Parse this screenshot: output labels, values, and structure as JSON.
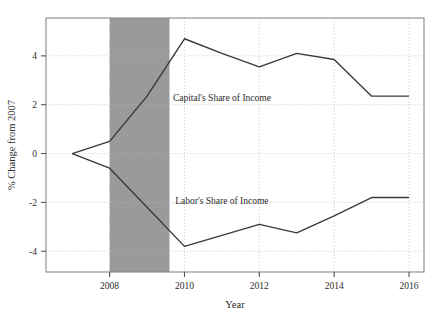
{
  "chart_data": {
    "type": "line",
    "title": "",
    "xlabel": "Year",
    "ylabel": "% Change from 2007",
    "xlim": [
      2006.3,
      2016.4
    ],
    "ylim": [
      -4.85,
      5.55
    ],
    "xticks": [
      2008,
      2010,
      2012,
      2014,
      2016
    ],
    "xticklabels": [
      "2008",
      "2010",
      "2012",
      "2014",
      "2016"
    ],
    "yticks": [
      4,
      2,
      0,
      -2,
      -4
    ],
    "yticklabels": [
      "4",
      "2",
      "0",
      "-2",
      "-4"
    ],
    "grid": true,
    "legend": "inline-annotations",
    "x": [
      2007,
      2008,
      2009,
      2010,
      2011,
      2012,
      2013,
      2014,
      2015,
      2016
    ],
    "series": [
      {
        "name": "Capital's Share of Income",
        "values": [
          0.0,
          0.5,
          2.35,
          4.7,
          4.1,
          3.55,
          4.1,
          3.85,
          2.35,
          2.35
        ],
        "label_x": 2011.0,
        "label_y": 2.15
      },
      {
        "name": "Labor's Share of Income",
        "values": [
          0.0,
          -0.6,
          -2.2,
          -3.8,
          -3.35,
          -2.9,
          -3.25,
          -2.55,
          -1.8,
          -1.8
        ],
        "label_x": 2011.0,
        "label_y": -2.05
      }
    ],
    "shaded_region": {
      "name": "recession-band",
      "x_start": 2008.0,
      "x_end": 2009.6,
      "color": "#9a9a9a"
    },
    "colors": {
      "line": "#3a3a3a",
      "grid": "#b8b8b8",
      "axis": "#555555",
      "band": "#9a9a9a",
      "background": "#ffffff"
    }
  }
}
